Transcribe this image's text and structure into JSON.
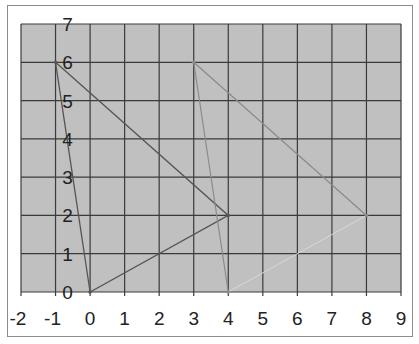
{
  "chart_data": {
    "type": "line",
    "title": "",
    "xlabel": "",
    "ylabel": "",
    "xlim": [
      -2,
      9
    ],
    "ylim": [
      0,
      7
    ],
    "grid": true,
    "legend": false,
    "x_ticks": [
      "-2",
      "-1",
      "0",
      "1",
      "2",
      "3",
      "4",
      "5",
      "6",
      "7",
      "8",
      "9"
    ],
    "y_ticks": [
      "0",
      "1",
      "2",
      "3",
      "4",
      "5",
      "6",
      "7"
    ],
    "series": [
      {
        "name": "Triangle A",
        "points": [
          [
            -1,
            6
          ],
          [
            4,
            2
          ],
          [
            0,
            0
          ],
          [
            -1,
            6
          ]
        ],
        "color": "#555555"
      },
      {
        "name": "Triangle B",
        "points": [
          [
            3,
            6
          ],
          [
            8,
            2
          ],
          [
            4,
            0
          ],
          [
            3,
            6
          ]
        ],
        "color": "#8a8a8a"
      }
    ],
    "plot_background": "#c0c0c0",
    "grid_color": "#3a3a3a"
  }
}
